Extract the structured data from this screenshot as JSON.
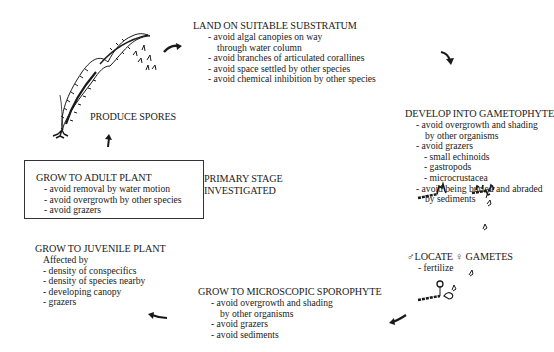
{
  "diagram": {
    "type": "life-cycle",
    "stages": [
      {
        "id": "land",
        "title": "LAND ON SUITABLE SUBSTRATUM",
        "items": [
          "- avoid algal canopies on way",
          "through water column",
          "- avoid branches of articulated corallines",
          "- avoid space settled by other species",
          "- avoid chemical inhibition by other species"
        ]
      },
      {
        "id": "gametophyte",
        "title": "DEVELOP INTO GAMETOPHYTE",
        "items": [
          "- avoid overgrowth and shading",
          "by other organisms",
          "- avoid grazers",
          "- small echinoids",
          "- gastropods",
          "- microcrustacea",
          "- avoid being buried and abraded",
          "by sediments"
        ]
      },
      {
        "id": "gametes",
        "title_male_symbol": "♂",
        "title_mid": "LOCATE",
        "title_female_symbol": "♀",
        "title_end": "GAMETES",
        "items": [
          "- fertilize"
        ]
      },
      {
        "id": "sporophyte",
        "title": "GROW TO MICROSCOPIC SPOROPHYTE",
        "items": [
          "- avoid overgrowth and shading",
          "by other organisms",
          "- avoid grazers",
          "- avoid sediments"
        ]
      },
      {
        "id": "juvenile",
        "title": "GROW TO JUVENILE PLANT",
        "items": [
          "Affected by",
          "- density of conspecifics",
          "- density of species nearby",
          "- developing canopy",
          "- grazers"
        ]
      },
      {
        "id": "adult",
        "title": "GROW TO ADULT PLANT",
        "items": [
          "- avoid removal by water motion",
          "- avoid overgrowth by other species",
          "- avoid grazers"
        ],
        "highlighted": true
      },
      {
        "id": "spores",
        "title": "PRODUCE SPORES",
        "items": []
      }
    ],
    "annotation": {
      "line1": "PRIMARY STAGE",
      "line2": "INVESTIGATED"
    },
    "colors": {
      "ink": "#1a1a1a",
      "background": "#ffffff",
      "box_border": "#333333"
    }
  }
}
